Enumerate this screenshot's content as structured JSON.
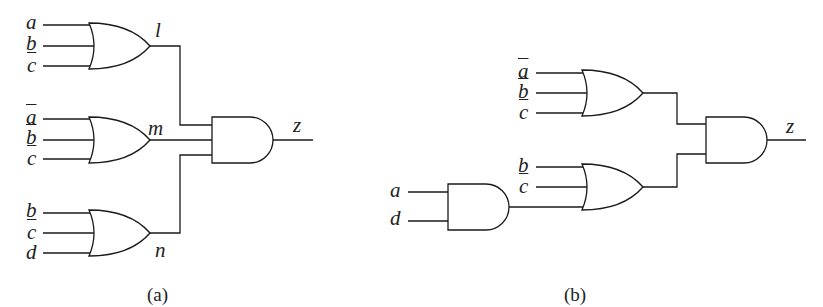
{
  "figure": {
    "a": {
      "caption": "(a)",
      "gates": [
        {
          "type": "OR",
          "inputs": [
            "a",
            "b",
            "c̄"
          ],
          "output": "l"
        },
        {
          "type": "OR",
          "inputs": [
            "ā",
            "b̄",
            "c̄"
          ],
          "output": "m"
        },
        {
          "type": "OR",
          "inputs": [
            "b",
            "c̄",
            "d"
          ],
          "output": "n"
        },
        {
          "type": "AND",
          "inputs": [
            "l",
            "m",
            "n"
          ],
          "output": "z"
        }
      ],
      "labels": {
        "in1_a": "a",
        "in1_b": "b",
        "in1_c": "c",
        "out1": "l",
        "in2_a": "a",
        "in2_b": "b",
        "in2_c": "c",
        "out2": "m",
        "in3_b": "b",
        "in3_c": "c",
        "in3_d": "d",
        "out3": "n",
        "out": "z"
      }
    },
    "b": {
      "caption": "(b)",
      "gates": [
        {
          "type": "OR",
          "inputs": [
            "ā",
            "b̄",
            "c̄"
          ]
        },
        {
          "type": "AND",
          "inputs": [
            "a",
            "d"
          ]
        },
        {
          "type": "OR",
          "inputs": [
            "b",
            "c̄",
            "AND(a,d)"
          ]
        },
        {
          "type": "AND",
          "inputs": [
            "OR1",
            "OR2"
          ],
          "output": "z"
        }
      ],
      "labels": {
        "top_a": "a",
        "top_b": "b",
        "top_c": "c",
        "bot_b": "b",
        "bot_c": "c",
        "and_a": "a",
        "and_d": "d",
        "out": "z"
      }
    }
  }
}
